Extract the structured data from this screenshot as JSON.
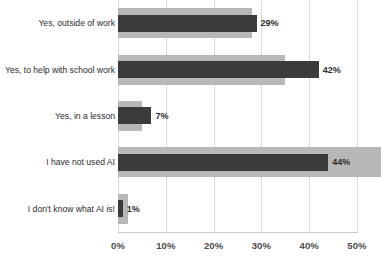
{
  "chart_data": {
    "type": "bar",
    "orientation": "horizontal",
    "title": "",
    "xlabel": "",
    "ylabel": "",
    "xlim": [
      0,
      50
    ],
    "grid": true,
    "legend": "none",
    "categories": [
      "Yes, outside of work",
      "Yes, to help with school work",
      "Yes, in a lesson",
      "I have not used AI",
      "I don't know what AI is!"
    ],
    "tick_labels": [
      "0%",
      "10%",
      "20%",
      "30%",
      "40%",
      "50%"
    ],
    "tick_values": [
      0,
      10,
      20,
      30,
      40,
      50
    ],
    "series": [
      {
        "name": "background",
        "color": "#b7b7b7",
        "values": [
          28,
          35,
          5,
          55,
          2
        ],
        "labels": [
          "",
          "",
          "",
          "",
          ""
        ]
      },
      {
        "name": "foreground",
        "color": "#3b3b3b",
        "values": [
          29,
          42,
          7,
          44,
          1
        ],
        "labels": [
          "29%",
          "42%",
          "7%",
          "44%",
          "1%"
        ]
      }
    ]
  }
}
